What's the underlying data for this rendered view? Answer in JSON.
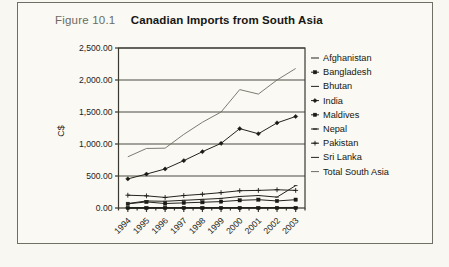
{
  "figure": {
    "number_label": "Figure 10.1",
    "title": "Canadian Imports from South Asia"
  },
  "chart_data": {
    "type": "line",
    "title": "Canadian Imports from South Asia",
    "xlabel": "",
    "ylabel": "C$",
    "categories": [
      "1994",
      "1995",
      "1996",
      "1997",
      "1998",
      "1999",
      "2000",
      "2001",
      "2002",
      "2003"
    ],
    "ylim": [
      0,
      2500
    ],
    "yticks": [
      0,
      500,
      1000,
      1500,
      2000,
      2500
    ],
    "ytick_labels": [
      "0.00",
      "500.00",
      "1,000.00",
      "1,500.00",
      "2,000.00",
      "2,500.00"
    ],
    "grid": true,
    "legend_position": "right",
    "series": [
      {
        "name": "Afghanistan",
        "marker": "dash",
        "values": [
          2,
          2,
          2,
          2,
          2,
          2,
          3,
          3,
          4,
          5
        ]
      },
      {
        "name": "Bangladesh",
        "marker": "dash-square",
        "values": [
          65,
          95,
          70,
          80,
          90,
          100,
          120,
          130,
          110,
          130
        ]
      },
      {
        "name": "Bhutan",
        "marker": "dash",
        "values": [
          1,
          1,
          1,
          1,
          1,
          1,
          1,
          1,
          1,
          1
        ]
      },
      {
        "name": "India",
        "marker": "diamond",
        "values": [
          455,
          530,
          610,
          740,
          880,
          1010,
          1240,
          1160,
          1330,
          1430
        ]
      },
      {
        "name": "Maldives",
        "marker": "square",
        "values": [
          1,
          1,
          1,
          1,
          1,
          1,
          1,
          1,
          1,
          1
        ]
      },
      {
        "name": "Nepal",
        "marker": "dash-dot",
        "values": [
          4,
          4,
          4,
          5,
          5,
          6,
          7,
          7,
          8,
          9
        ]
      },
      {
        "name": "Pakistan",
        "marker": "plus",
        "values": [
          200,
          190,
          165,
          195,
          215,
          240,
          270,
          275,
          285,
          275
        ]
      },
      {
        "name": "Sri Lanka",
        "marker": "dash",
        "values": [
          70,
          110,
          105,
          120,
          135,
          150,
          180,
          195,
          170,
          350
        ]
      },
      {
        "name": "Total South Asia",
        "marker": "line",
        "values": [
          800,
          930,
          935,
          1150,
          1340,
          1500,
          1850,
          1780,
          2000,
          2180
        ]
      }
    ]
  },
  "legend": {
    "items": [
      {
        "label": "Afghanistan"
      },
      {
        "label": "Bangladesh"
      },
      {
        "label": "Bhutan"
      },
      {
        "label": "India"
      },
      {
        "label": "Maldives"
      },
      {
        "label": "Nepal"
      },
      {
        "label": "Pakistan"
      },
      {
        "label": "Sri Lanka"
      },
      {
        "label": "Total South Asia"
      }
    ]
  }
}
